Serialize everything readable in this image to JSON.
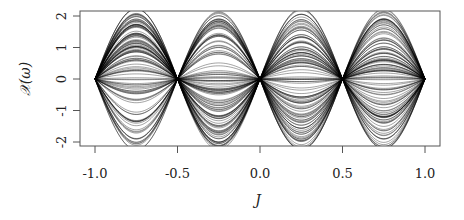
{
  "chart_data": {
    "type": "line",
    "title": "",
    "xlabel": "J",
    "ylabel": "𝒳(ω)",
    "xlim": [
      -1.08,
      1.08
    ],
    "ylim": [
      -2.1,
      2.1
    ],
    "x_ticks": [
      "-1.0",
      "-0.5",
      "0.0",
      "0.5",
      "1.0"
    ],
    "x_tick_values": [
      -1.0,
      -0.5,
      0.0,
      0.5,
      1.0
    ],
    "y_ticks": [
      "-2",
      "-1",
      "0",
      "1",
      "2"
    ],
    "y_tick_values": [
      -2,
      -1,
      0,
      1,
      2
    ],
    "grid": false,
    "legend": null,
    "zeros": [
      -1.0,
      -0.5,
      0.0,
      0.5,
      1.0
    ],
    "peak_locations": [
      -0.75,
      -0.25,
      0.25,
      0.75
    ],
    "amplitude_range": [
      -2.2,
      2.2
    ],
    "series_count_approx": 120,
    "line_color": "#000000"
  },
  "labels": {
    "xlabel": "J",
    "ylabel": "𝒳(ω)",
    "x_ticks": [
      "-1.0",
      "-0.5",
      "0.0",
      "0.5",
      "1.0"
    ],
    "y_ticks": [
      "-2",
      "-1",
      "0",
      "1",
      "2"
    ]
  }
}
